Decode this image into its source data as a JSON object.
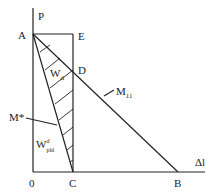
{
  "diagram": {
    "axes": {
      "y_label": "P",
      "x_label": "Δl",
      "origin_label": "0"
    },
    "points": {
      "A": "A",
      "E": "E",
      "D": "D",
      "C": "C",
      "B": "B"
    },
    "labels": {
      "Wd_main": "W",
      "Wd_sub": "d",
      "M_star": "M*",
      "M11_main": "M",
      "M11_sub": "11",
      "Wpld_main": "W",
      "Wpld_sup": "d",
      "Wpld_sub": "pld"
    },
    "colors": {
      "line": "#222222",
      "background": "#ffffff"
    }
  }
}
